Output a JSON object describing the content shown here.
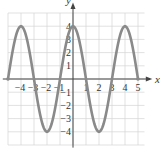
{
  "chart_data": {
    "type": "line",
    "title": "",
    "xlabel": "x",
    "ylabel": "y",
    "xlim": [
      -5,
      5
    ],
    "ylim": [
      -4,
      4
    ],
    "grid": true,
    "series": [
      {
        "name": "y = 4cos(πx/2)",
        "x": [
          -5,
          -4,
          -3,
          -2,
          -1,
          0,
          1,
          2,
          3,
          4,
          5
        ],
        "values": [
          0,
          4,
          0,
          -4,
          0,
          4,
          0,
          -4,
          0,
          4,
          0
        ]
      }
    ],
    "x_ticks": [
      "-4",
      "-3",
      "-2",
      "-1",
      "1",
      "2",
      "3",
      "4",
      "5"
    ],
    "y_ticks": [
      "4",
      "3",
      "2",
      "1",
      "-1",
      "-2",
      "-3",
      "-4"
    ]
  },
  "labels": {
    "x": "x",
    "y": "y"
  },
  "colors": {
    "curve": "#8a8a8a",
    "grid": "#d4d4d4",
    "axis": "#444444"
  }
}
